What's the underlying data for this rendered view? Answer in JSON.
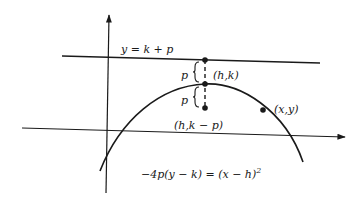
{
  "figure": {
    "type": "parabola-diagram",
    "labels": {
      "directrix": "y = k + p",
      "p_upper": "p",
      "p_lower": "p",
      "vertex": "(h,k)",
      "focus": "(h,k − p)",
      "point": "(x,y)",
      "equation_main": "−4p(y − k) = (x − h)",
      "equation_exp": "2"
    },
    "colors": {
      "stroke": "#1a1a1a",
      "background": "#ffffff"
    }
  }
}
